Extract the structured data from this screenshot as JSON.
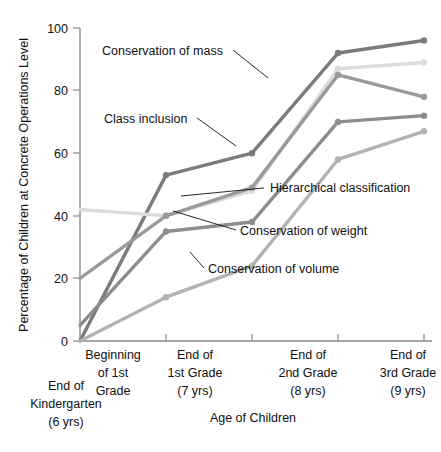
{
  "chart_data": {
    "type": "line",
    "title": "",
    "xlabel": "Age of Children",
    "ylabel": "Percentage of Children at Concrete Operations Level",
    "ylim": [
      0,
      100
    ],
    "yticks": [
      0,
      20,
      40,
      60,
      80,
      100
    ],
    "grid": false,
    "legend_position": "inline-annotations",
    "categories": [
      "End of Kindergarten (6 yrs)",
      "Beginning of 1st Grade",
      "End of 1st Grade (7 yrs)",
      "End of 2nd Grade (8 yrs)",
      "End of 3rd Grade (9 yrs)"
    ],
    "category_lines": [
      [
        "End of",
        "Kindergarten",
        "(6 yrs)"
      ],
      [
        "Beginning",
        "of 1st",
        "Grade"
      ],
      [
        "End of",
        "1st Grade",
        "(7 yrs)"
      ],
      [
        "End of",
        "2nd Grade",
        "(8 yrs)"
      ],
      [
        "End of",
        "3rd Grade",
        "(9 yrs)"
      ]
    ],
    "series": [
      {
        "name": "Conservation of mass",
        "color": "#7b7b7b",
        "values": [
          0,
          53,
          60,
          92,
          96
        ]
      },
      {
        "name": "Class inclusion",
        "color": "#dcdcdc",
        "values": [
          42,
          40,
          48,
          87,
          89
        ]
      },
      {
        "name": "Hierarchical classification",
        "color": "#9a9a9a",
        "values": [
          20,
          40,
          49,
          85,
          78
        ]
      },
      {
        "name": "Conservation of weight",
        "color": "#8d8d8d",
        "values": [
          5,
          35,
          38,
          70,
          72
        ]
      },
      {
        "name": "Conservation of volume",
        "color": "#b3b3b3",
        "values": [
          0,
          14,
          24,
          58,
          67
        ]
      }
    ]
  },
  "axis": {
    "y_title": "Percentage of Children at Concrete Operations Level",
    "x_title": "Age of Children",
    "y_tick_0": "0",
    "y_tick_20": "20",
    "y_tick_40": "40",
    "y_tick_60": "60",
    "y_tick_80": "80",
    "y_tick_100": "100"
  },
  "annotations": {
    "mass": "Conservation of mass",
    "class_inclusion": "Class inclusion",
    "hierarchical": "Hierarchical classification",
    "weight": "Conservation of weight",
    "volume": "Conservation of volume"
  },
  "x_labels": {
    "k0_l1": "End of",
    "k0_l2": "Kindergarten",
    "k0_l3": "(6 yrs)",
    "k1_l1": "Beginning",
    "k1_l2": "of 1st",
    "k1_l3": "Grade",
    "k2_l1": "End of",
    "k2_l2": "1st Grade",
    "k2_l3": "(7 yrs)",
    "k3_l1": "End of",
    "k3_l2": "2nd Grade",
    "k3_l3": "(8 yrs)",
    "k4_l1": "End of",
    "k4_l2": "3rd Grade",
    "k4_l3": "(9 yrs)"
  }
}
